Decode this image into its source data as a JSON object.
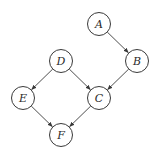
{
  "diagram": {
    "type": "directed-graph",
    "node_radius": 11.5,
    "nodes": [
      {
        "id": "A",
        "label": "A",
        "x": 99,
        "y": 24
      },
      {
        "id": "B",
        "label": "B",
        "x": 137,
        "y": 61
      },
      {
        "id": "D",
        "label": "D",
        "x": 61,
        "y": 61
      },
      {
        "id": "E",
        "label": "E",
        "x": 23,
        "y": 98
      },
      {
        "id": "C",
        "label": "C",
        "x": 99,
        "y": 98
      },
      {
        "id": "F",
        "label": "F",
        "x": 61,
        "y": 135
      }
    ],
    "edges": [
      {
        "from": "A",
        "to": "B"
      },
      {
        "from": "B",
        "to": "C"
      },
      {
        "from": "D",
        "to": "E"
      },
      {
        "from": "D",
        "to": "C"
      },
      {
        "from": "E",
        "to": "F"
      },
      {
        "from": "C",
        "to": "F"
      }
    ]
  }
}
